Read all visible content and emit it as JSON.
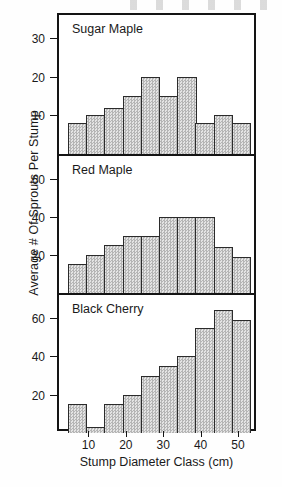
{
  "chart_data": {
    "type": "bar",
    "title": "",
    "xlabel": "Stump Diameter Class (cm)",
    "ylabel": "Average # Of Sprouts Per Stump",
    "grid": false,
    "legend": "none",
    "x_ticks": [
      10,
      20,
      30,
      40,
      50
    ],
    "xlim": [
      4,
      54
    ],
    "categories": [
      "5",
      "10",
      "15",
      "20",
      "25",
      "30",
      "35",
      "40",
      "45",
      "50"
    ],
    "panels": [
      {
        "label": "Sugar Maple",
        "y_ticks": [
          10,
          20,
          30
        ],
        "ylim": [
          0,
          36
        ],
        "values": [
          8,
          10,
          12,
          15,
          20,
          15,
          20,
          8,
          10,
          8
        ]
      },
      {
        "label": "Red Maple",
        "y_ticks": [
          20,
          40,
          60
        ],
        "ylim": [
          0,
          72
        ],
        "values": [
          15,
          20,
          25,
          30,
          30,
          40,
          40,
          40,
          24,
          19
        ]
      },
      {
        "label": "Black Cherry",
        "y_ticks": [
          20,
          40,
          60
        ],
        "ylim": [
          0,
          72
        ],
        "values": [
          15,
          3,
          15,
          20,
          30,
          35,
          40,
          55,
          64,
          59
        ]
      }
    ]
  }
}
